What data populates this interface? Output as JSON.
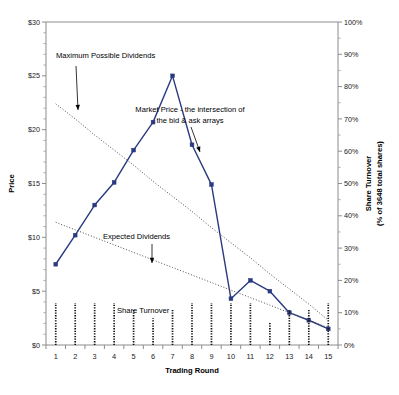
{
  "chart_data": {
    "type": "line",
    "title": "",
    "xlabel": "Trading Round",
    "ylabel": "Price",
    "y2label_line1": "Share Turnover",
    "y2label_line2": "(% of 3648 total shares)",
    "x": [
      1,
      2,
      3,
      4,
      5,
      6,
      7,
      8,
      9,
      10,
      11,
      12,
      13,
      14,
      15
    ],
    "xtick_labels": [
      "1",
      "2",
      "3",
      "4",
      "5",
      "6",
      "7",
      "8",
      "9",
      "10",
      "11",
      "12",
      "13",
      "14",
      "15"
    ],
    "ylim": [
      0,
      30
    ],
    "ytick_labels": [
      "$0",
      "$5",
      "$10",
      "$15",
      "$20",
      "$25",
      "$30"
    ],
    "ytick_values": [
      0,
      5,
      10,
      15,
      20,
      25,
      30
    ],
    "y2lim": [
      0,
      100
    ],
    "y2tick_labels": [
      "0%",
      "10%",
      "20%",
      "30%",
      "40%",
      "50%",
      "60%",
      "70%",
      "80%",
      "90%",
      "100%"
    ],
    "y2tick_values": [
      0,
      10,
      20,
      30,
      40,
      50,
      60,
      70,
      80,
      90,
      100
    ],
    "grid": false,
    "legend_position": "inline-annotations",
    "series": [
      {
        "name": "Market Price - the intersection of the bid & ask arrays",
        "axis": "left",
        "color": "#2b3a80",
        "style": "line-markers",
        "values": [
          7.5,
          10.2,
          13.0,
          15.1,
          18.1,
          20.7,
          25.0,
          18.6,
          14.9,
          4.3,
          6.0,
          5.0,
          3.0,
          2.3,
          1.5
        ]
      },
      {
        "name": "Maximum Possible Dividends",
        "axis": "left",
        "color": "#4d4d4d",
        "style": "dotted-trend",
        "values": [
          22.4,
          21.0,
          19.5,
          18.1,
          16.7,
          15.2,
          13.8,
          12.4,
          10.9,
          9.5,
          8.1,
          6.6,
          5.2,
          3.8,
          2.3
        ]
      },
      {
        "name": "Expected Dividends",
        "axis": "left",
        "color": "#4d4d4d",
        "style": "dotted-trend",
        "values": [
          11.4,
          10.7,
          10.0,
          9.3,
          8.6,
          7.9,
          7.2,
          6.5,
          5.8,
          5.1,
          4.4,
          3.7,
          3.0,
          2.3,
          1.6
        ]
      },
      {
        "name": "Share Turnover",
        "axis": "right",
        "color": "#111111",
        "style": "dotted-bars",
        "values": [
          13.0,
          13.0,
          13.0,
          13.0,
          11.3,
          8.3,
          11.3,
          13.0,
          13.0,
          13.0,
          13.0,
          6.8,
          11.3,
          11.3,
          13.0
        ]
      }
    ],
    "annotations": [
      {
        "name": "max-dividends",
        "text": "Maximum Possible Dividends",
        "text_x": 56,
        "text_y": 58,
        "arrow_x1": 76,
        "arrow_y1": 66,
        "arrow_x2": 78,
        "arrow_y2": 110
      },
      {
        "name": "market-price",
        "line1": "Market Price - the intersection of",
        "line2": "the bid & ask arrays",
        "text_x": 190,
        "text_y": 112,
        "arrow_x1": 191,
        "arrow_y1": 127,
        "arrow_x2": 200,
        "arrow_y2": 152
      },
      {
        "name": "expected-dividends",
        "text": "Expected Dividends",
        "text_x": 103,
        "text_y": 239,
        "arrow_x1": 152,
        "arrow_y1": 244,
        "arrow_x2": 152,
        "arrow_y2": 263
      },
      {
        "name": "share-turnover",
        "text": "Share Turnover",
        "text_x": 117,
        "text_y": 313
      }
    ]
  }
}
